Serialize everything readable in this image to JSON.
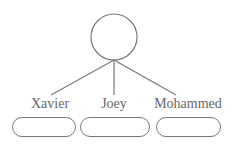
{
  "diagram": {
    "root": {
      "shape": "circle"
    },
    "children": [
      {
        "label": "Xavier"
      },
      {
        "label": "Joey"
      },
      {
        "label": "Mohammed"
      }
    ],
    "colors": {
      "stroke": "#777777",
      "text": "#666666"
    }
  }
}
